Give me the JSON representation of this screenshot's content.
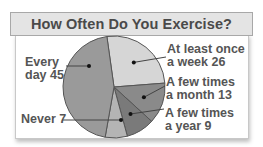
{
  "header": {
    "title": "How Often Do You Exercise?"
  },
  "labels": {
    "every_day": [
      "Every",
      "day 45"
    ],
    "never": "Never 7",
    "weekly": [
      "At least once",
      "a week 26"
    ],
    "monthly": [
      "A few times",
      "a month 13"
    ],
    "yearly": [
      "A few times",
      "a year 9"
    ]
  },
  "colors": {
    "every_day": "#9a9a9a",
    "weekly": "#d6d6d6",
    "monthly": "#8a8a8a",
    "yearly": "#7a7a7a",
    "never": "#b4b4b4",
    "header_bg": "#e4e4e4",
    "text": "#555555"
  },
  "chart_data": {
    "type": "pie",
    "title": "How Often Do You Exercise?",
    "categories": [
      "At least once a week",
      "A few times a month",
      "A few times a year",
      "Never",
      "Every day"
    ],
    "values": [
      26,
      13,
      9,
      7,
      45
    ],
    "legend": "none (callout labels)"
  }
}
